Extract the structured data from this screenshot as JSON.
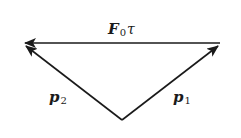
{
  "diagram": {
    "type": "vector-triangle",
    "vectors": [
      {
        "id": "top",
        "label_main": "F",
        "label_sub": "0",
        "label_extra": "τ",
        "from": [
          220,
          43
        ],
        "to": [
          24,
          43
        ]
      },
      {
        "id": "left",
        "label_main": "p",
        "label_sub": "2",
        "from": [
          122,
          120
        ],
        "to": [
          25,
          45
        ]
      },
      {
        "id": "right",
        "label_main": "p",
        "label_sub": "1",
        "from": [
          122,
          120
        ],
        "to": [
          219,
          45
        ]
      }
    ],
    "stroke_color": "#1a1a1a"
  }
}
